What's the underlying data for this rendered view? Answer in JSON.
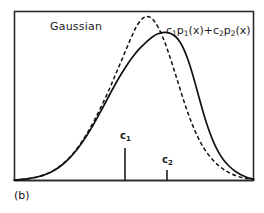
{
  "figure": {
    "panel_caption": "(b)",
    "background_color": "#ffffff",
    "frame_color": "#2b2b2b",
    "curve_color": "#111111",
    "labels": {
      "gaussian": "Gaussian",
      "mixture_c1": "c",
      "mixture_c1_sub": "1",
      "mixture_p1": "p",
      "mixture_p1_sub": "1",
      "mixture_arg1": "(x)+",
      "mixture_c2": "c",
      "mixture_c2_sub": "2",
      "mixture_p2": "p",
      "mixture_p2_sub": "2",
      "mixture_arg2": "(x)",
      "tick_c1": "c",
      "tick_c1_sub": "1",
      "tick_c2": "c",
      "tick_c2_sub": "2"
    }
  },
  "chart_data": {
    "type": "line",
    "title": "",
    "xlabel": "",
    "ylabel": "",
    "grid": false,
    "legend_position": "inline-annotation",
    "axis_frame": {
      "x0": 14,
      "y0": 11,
      "x1": 254,
      "y1": 181
    },
    "xlim": [
      14,
      254
    ],
    "ylim": [
      0,
      1
    ],
    "annotations": [
      {
        "name": "gaussian",
        "text": "Gaussian",
        "x": 50,
        "y": 21
      },
      {
        "name": "mixture",
        "text": "c1p1(x)+c2p2(x)",
        "x": 166,
        "y": 25
      }
    ],
    "tick_marks": [
      {
        "name": "c1",
        "label": "c1",
        "x": 125,
        "y_top": 148,
        "y_bottom": 180,
        "length": 32
      },
      {
        "name": "c2",
        "label": "c2",
        "x": 167,
        "y_top": 170,
        "y_bottom": 180,
        "length": 10
      }
    ],
    "series": [
      {
        "name": "Gaussian",
        "style": "dashed",
        "peak_x": 135,
        "peak_y": 17,
        "points": [
          [
            14,
            180
          ],
          [
            22,
            179.4
          ],
          [
            30,
            178.4
          ],
          [
            38,
            176.8
          ],
          [
            46,
            174.2
          ],
          [
            54,
            170.2
          ],
          [
            62,
            164.6
          ],
          [
            70,
            157.0
          ],
          [
            78,
            147.2
          ],
          [
            86,
            135.2
          ],
          [
            94,
            121.0
          ],
          [
            102,
            105.0
          ],
          [
            110,
            87.6
          ],
          [
            116,
            73.4
          ],
          [
            122,
            59.4
          ],
          [
            128,
            45.0
          ],
          [
            134,
            31.4
          ],
          [
            138,
            24.0
          ],
          [
            142,
            19.0
          ],
          [
            146,
            16.6
          ],
          [
            150,
            17.2
          ],
          [
            154,
            20.8
          ],
          [
            158,
            27.0
          ],
          [
            162,
            35.4
          ],
          [
            166,
            45.6
          ],
          [
            170,
            57.2
          ],
          [
            174,
            69.6
          ],
          [
            178,
            82.4
          ],
          [
            182,
            95.2
          ],
          [
            186,
            107.4
          ],
          [
            190,
            118.6
          ],
          [
            194,
            128.6
          ],
          [
            198,
            137.4
          ],
          [
            202,
            145.0
          ],
          [
            206,
            151.4
          ],
          [
            212,
            159.0
          ],
          [
            218,
            165.0
          ],
          [
            224,
            169.6
          ],
          [
            230,
            173.2
          ],
          [
            236,
            175.8
          ],
          [
            242,
            177.6
          ],
          [
            248,
            178.8
          ],
          [
            254,
            179.6
          ]
        ]
      },
      {
        "name": "c1p1(x)+c2p2(x)",
        "style": "solid",
        "peak_x": 152,
        "peak_y": 32,
        "points": [
          [
            14,
            180
          ],
          [
            22,
            179.4
          ],
          [
            30,
            178.4
          ],
          [
            38,
            176.8
          ],
          [
            46,
            174.2
          ],
          [
            54,
            170.4
          ],
          [
            62,
            165.0
          ],
          [
            70,
            157.6
          ],
          [
            78,
            148.2
          ],
          [
            86,
            136.8
          ],
          [
            94,
            123.6
          ],
          [
            102,
            109.0
          ],
          [
            110,
            94.0
          ],
          [
            116,
            83.0
          ],
          [
            122,
            72.8
          ],
          [
            128,
            63.4
          ],
          [
            134,
            55.2
          ],
          [
            140,
            48.2
          ],
          [
            146,
            42.4
          ],
          [
            152,
            37.2
          ],
          [
            158,
            33.8
          ],
          [
            164,
            32.4
          ],
          [
            170,
            33.2
          ],
          [
            176,
            37.0
          ],
          [
            180,
            42.0
          ],
          [
            184,
            49.6
          ],
          [
            188,
            59.8
          ],
          [
            192,
            72.2
          ],
          [
            196,
            86.4
          ],
          [
            200,
            101.0
          ],
          [
            204,
            115.0
          ],
          [
            208,
            127.6
          ],
          [
            212,
            138.4
          ],
          [
            216,
            147.4
          ],
          [
            220,
            154.6
          ],
          [
            224,
            160.4
          ],
          [
            228,
            165.0
          ],
          [
            234,
            170.4
          ],
          [
            240,
            174.2
          ],
          [
            246,
            177.0
          ],
          [
            250,
            178.4
          ],
          [
            254,
            179.4
          ]
        ]
      }
    ]
  }
}
